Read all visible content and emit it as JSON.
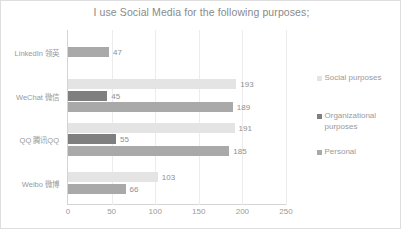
{
  "chart_data": {
    "type": "bar",
    "orientation": "horizontal",
    "title": "I use Social Media for the following purposes;",
    "xlabel": "",
    "ylabel": "",
    "xlim": [
      0,
      250
    ],
    "xticks": [
      "0",
      "50",
      "100",
      "150",
      "200",
      "250"
    ],
    "grid": true,
    "legend_position": "right",
    "categories": [
      "LinkedIn 领英",
      "WeChat 微信",
      "QQ 腾讯QQ",
      "Weibo 微博"
    ],
    "series": [
      {
        "name": "Social purposes",
        "color": "#e4e4e4",
        "values": [
          null,
          193,
          191,
          103
        ]
      },
      {
        "name": "Organizational purposes",
        "color": "#7f7f7f",
        "values": [
          null,
          45,
          55,
          null
        ]
      },
      {
        "name": "Personal",
        "color": "#a9a9a9",
        "values": [
          47,
          189,
          185,
          66
        ]
      }
    ],
    "data_labels": {
      "linkedin": {
        "personal": "47"
      },
      "wechat": {
        "social": "193",
        "organizational": "45",
        "personal": "189"
      },
      "qq": {
        "social": "191",
        "organizational": "55",
        "personal": "185"
      },
      "weibo": {
        "social": "103",
        "personal": "66"
      }
    }
  },
  "legend": {
    "items": [
      {
        "label": "Social purposes",
        "swatch": "social"
      },
      {
        "label": "Organizational purposes",
        "swatch": "organizational"
      },
      {
        "label": "Personal",
        "swatch": "personal"
      }
    ]
  }
}
